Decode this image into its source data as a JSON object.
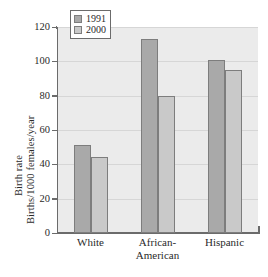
{
  "chart_data": {
    "type": "bar",
    "title": "",
    "xlabel": "",
    "ylabel_line1": "Birth rate",
    "ylabel_line2": "Births/1000 females/year",
    "categories": [
      "White",
      "African-American",
      "Hispanic"
    ],
    "category_display": [
      {
        "line1": "White",
        "line2": ""
      },
      {
        "line1": "African-",
        "line2": "American"
      },
      {
        "line1": "Hispanic",
        "line2": ""
      }
    ],
    "series": [
      {
        "name": "1991",
        "values": [
          51,
          113,
          101
        ],
        "color": "#a9a9a9"
      },
      {
        "name": "2000",
        "values": [
          44,
          80,
          95
        ],
        "color": "#c9c9c9"
      }
    ],
    "ylim": [
      0,
      120
    ],
    "yticks": [
      0,
      20,
      40,
      60,
      80,
      100,
      120
    ],
    "ytick_labels": [
      "0",
      "20",
      "40",
      "60",
      "80",
      "100",
      "120"
    ],
    "grid": "horizontal",
    "legend_position": "top-left-inside",
    "plot_background": "#ebebeb",
    "axis_color": "#6b6b6b"
  },
  "legend": {
    "items": [
      {
        "label": "1991",
        "color": "#a9a9a9"
      },
      {
        "label": "2000",
        "color": "#c9c9c9"
      }
    ]
  }
}
